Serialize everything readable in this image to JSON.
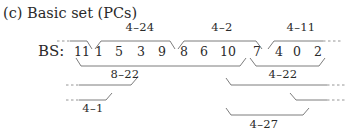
{
  "title": "(c) Basic set (PCs)",
  "row_label": "BS:",
  "pitch_classes": [
    "11",
    "1",
    "5",
    "3",
    "9",
    "8",
    "6",
    "10",
    "7",
    "4",
    "0",
    "2"
  ],
  "segments": {
    "upper": [
      {
        "label": "4–24",
        "spans": [
          "1",
          "5",
          "3",
          "9"
        ]
      },
      {
        "label": "4–2",
        "spans": [
          "8",
          "6",
          "10",
          "7"
        ]
      },
      {
        "label": "4–11",
        "spans": [
          "4",
          "0",
          "2",
          "…"
        ]
      }
    ],
    "lower": [
      {
        "label": "8–22",
        "spans": [
          "11",
          "1",
          "5",
          "3",
          "9",
          "8",
          "6",
          "10"
        ]
      },
      {
        "label": "4–22",
        "spans": [
          "7",
          "4",
          "0",
          "2"
        ]
      },
      {
        "label": "4–1",
        "spans": [
          "…",
          "11"
        ]
      },
      {
        "label": "4–27",
        "spans": [
          "10",
          "7",
          "4",
          "0"
        ]
      }
    ]
  },
  "labels": {
    "u1": "4–24",
    "u2": "4–2",
    "u3": "4–11",
    "l1": "8–22",
    "l2": "4–22",
    "l3": "4–1",
    "l4": "4–27"
  }
}
